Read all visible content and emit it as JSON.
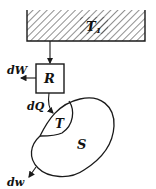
{
  "diagram": {
    "reservoir": {
      "label": "T",
      "subscript": "1"
    },
    "engine": {
      "label": "R"
    },
    "work_out": {
      "label": "dW"
    },
    "heat_in": {
      "label": "dQ"
    },
    "subsystem": {
      "label": "T"
    },
    "system": {
      "label": "S"
    },
    "system_work": {
      "label": "dw"
    }
  },
  "colors": {
    "stroke": "#1a1a1a",
    "background": "#ffffff"
  }
}
